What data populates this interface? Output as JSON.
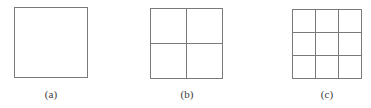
{
  "figure": {
    "background_color": "#ffffff",
    "line_color": "#7a7a7a",
    "line_width_px": 1.4,
    "caption_color": "#3b3b3b",
    "items": [
      {
        "id": "figure-a",
        "caption": "(a)",
        "rows": 1,
        "cols": 1,
        "cell_count": 1,
        "x": 14,
        "y": 7,
        "width": 74,
        "height": 71,
        "caption_center_x": 51,
        "caption_y": 88
      },
      {
        "id": "figure-b",
        "caption": "(b)",
        "rows": 2,
        "cols": 2,
        "cell_count": 4,
        "x": 150,
        "y": 8,
        "width": 73,
        "height": 71,
        "caption_center_x": 187,
        "caption_y": 88
      },
      {
        "id": "figure-c",
        "caption": "(c)",
        "rows": 3,
        "cols": 3,
        "cell_count": 9,
        "x": 292,
        "y": 9,
        "width": 70,
        "height": 70,
        "caption_center_x": 327,
        "caption_y": 88
      }
    ]
  }
}
